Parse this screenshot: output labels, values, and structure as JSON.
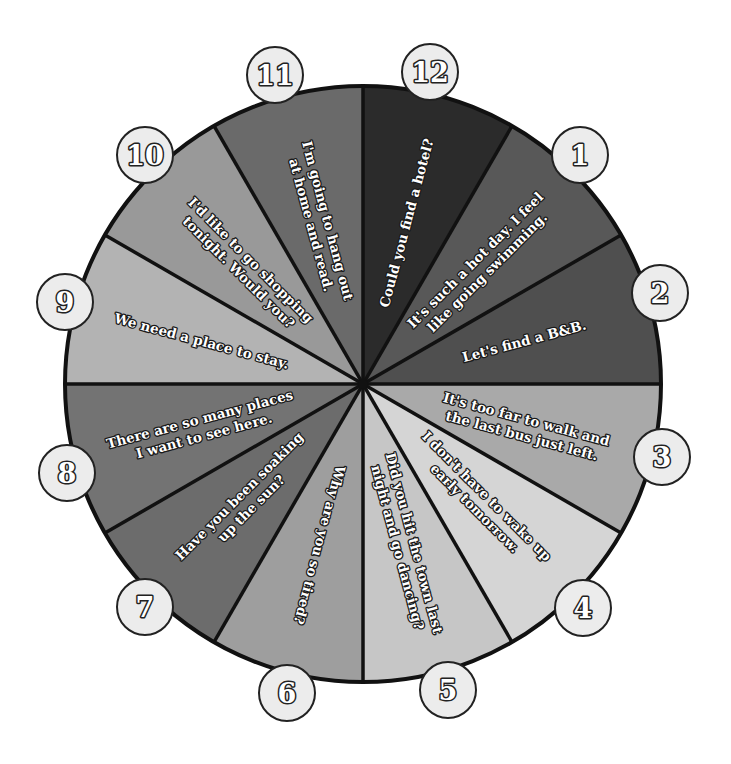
{
  "wheel": {
    "center": [
      363,
      384
    ],
    "radius": 298,
    "segments": [
      {
        "number": "12",
        "lines": [
          "Could you find a hotel?"
        ],
        "color": "#2b2b2b",
        "circle": [
          430,
          72
        ]
      },
      {
        "number": "1",
        "lines": [
          "It's such a hot day. I feel",
          "like going swimming."
        ],
        "color": "#585858",
        "circle": [
          580,
          155
        ]
      },
      {
        "number": "2",
        "lines": [
          "Let's find a B&B."
        ],
        "color": "#4f4f4f",
        "circle": [
          660,
          293
        ]
      },
      {
        "number": "3",
        "lines": [
          "It's too far to walk and",
          "the last bus just left."
        ],
        "color": "#a9a9a9",
        "circle": [
          662,
          457
        ]
      },
      {
        "number": "4",
        "lines": [
          "I don't have to wake up",
          "early tomorrow."
        ],
        "color": "#d5d5d5",
        "circle": [
          583,
          608
        ]
      },
      {
        "number": "5",
        "lines": [
          "Did you hit the town last",
          "night and go dancing?"
        ],
        "color": "#c6c6c6",
        "circle": [
          448,
          690
        ]
      },
      {
        "number": "6",
        "lines": [
          "Why are you so tired?"
        ],
        "color": "#9e9e9e",
        "circle": [
          287,
          693
        ]
      },
      {
        "number": "7",
        "lines": [
          "Have you been soaking",
          "up the sun?"
        ],
        "color": "#6c6c6c",
        "circle": [
          145,
          607
        ]
      },
      {
        "number": "8",
        "lines": [
          "There are so many places",
          "I want to see here."
        ],
        "color": "#737373",
        "circle": [
          67,
          473
        ]
      },
      {
        "number": "9",
        "lines": [
          "We need a place to stay."
        ],
        "color": "#b3b3b3",
        "circle": [
          65,
          302
        ]
      },
      {
        "number": "10",
        "lines": [
          "I'd like to go shopping",
          "tonight. Would you?"
        ],
        "color": "#999999",
        "circle": [
          145,
          155
        ]
      },
      {
        "number": "11",
        "lines": [
          "I'm going to hang out",
          "at home and read."
        ],
        "color": "#6a6a6a",
        "circle": [
          275,
          75
        ]
      }
    ],
    "colors": {
      "outline": "#111111",
      "number_circle_fill": "#ececec",
      "text_fill": "#ffffff"
    }
  }
}
